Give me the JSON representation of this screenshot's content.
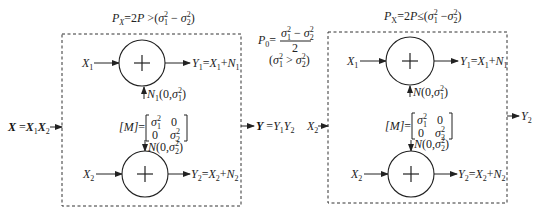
{
  "left_panel": {
    "title": "P_X=2P >(σ₁² − σ₂²)",
    "title_parts": {
      "p": "P",
      "x": "X",
      "eq": "=2",
      "p2": "P",
      "rel": " >(",
      "s1": "σ",
      "s1sub": "1",
      "s1sup": "2",
      "minus": " − ",
      "s2": "σ",
      "s2sub": "2",
      "s2sup": "2",
      "close": ")"
    },
    "input_label": "X =X₁X₂",
    "input_parts": {
      "X": "X",
      "eq": " =",
      "x1": "X",
      "x1sub": "1",
      "x2": "X",
      "x2sub": "2"
    },
    "output_label": "Y =Y₁Y₂",
    "output_parts": {
      "Y": "Y",
      "eq": " =",
      "y1": "Y",
      "y1sub": "1",
      "y2": "Y",
      "y2sub": "2"
    },
    "adder_top": {
      "in": "X₁",
      "in_parts": {
        "x": "X",
        "sub": "1"
      },
      "out": "Y₁=X₁+N₁",
      "noise": "N₁(0,σ₁²)",
      "symbol": "+"
    },
    "matrix": {
      "label": "[M]=",
      "rows": [
        [
          "σ₁²",
          "0"
        ],
        [
          "0",
          "σ₂²"
        ]
      ]
    },
    "adder_bottom": {
      "in": "X₂",
      "out": "Y₂=X₂+N₂",
      "noise": "N(0,σ₂²)",
      "symbol": "+"
    }
  },
  "middle": {
    "formula": "P₀= (σ₁² − σ₂²)/2",
    "p0": "P",
    "p0sub": "0",
    "eq": "=",
    "numerator": "σ₁² − σ₂²",
    "denominator": "2",
    "condition": "(σ₁² > σ₂²)"
  },
  "right_panel": {
    "title": "P_X=2P ≤(σ₁² − σ₂²)",
    "input_label": "X₂",
    "output_label": "Y₂",
    "adder_top": {
      "in": "X₁",
      "out": "Y₁=X₁+N₁",
      "noise": "N(0,σ₁²)",
      "symbol": "+"
    },
    "matrix": {
      "label": "[M]=",
      "rows": [
        [
          "σ₁²",
          "0"
        ],
        [
          "0",
          "σ₂²"
        ]
      ]
    },
    "adder_bottom": {
      "in": "X₂",
      "out": "Y₂=X₂+N₂",
      "noise": "N(0,σ₂²)",
      "symbol": "+"
    }
  },
  "colors": {
    "line": "#222222",
    "background": "#ffffff"
  }
}
